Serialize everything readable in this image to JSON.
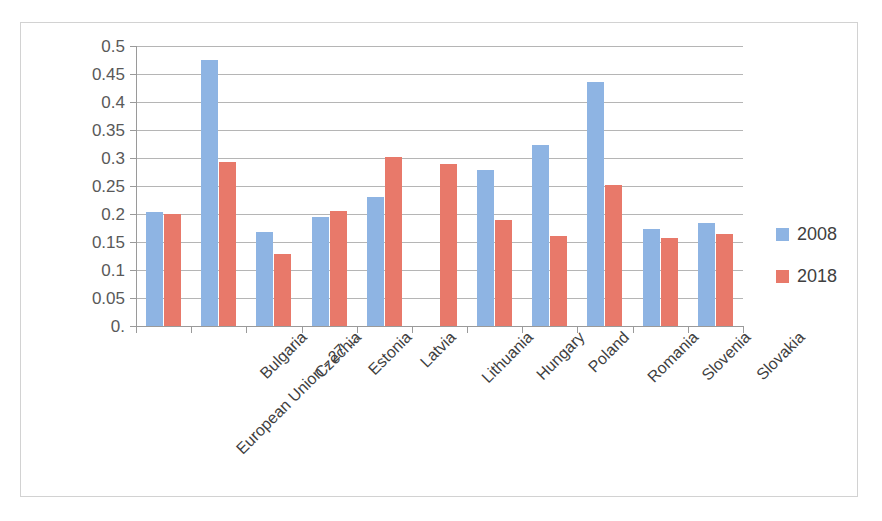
{
  "chart_data": {
    "type": "bar",
    "title": "",
    "xlabel": "",
    "ylabel": "",
    "ylim": [
      0,
      0.5
    ],
    "grid": true,
    "legend_position": "right",
    "ytick_labels": [
      "0.5",
      "0.45",
      "0.4",
      "0.35",
      "0.3",
      "0.25",
      "0.2",
      "0.15",
      "0.1",
      "0.05",
      "0."
    ],
    "ytick_values": [
      0.5,
      0.45,
      0.4,
      0.35,
      0.3,
      0.25,
      0.2,
      0.15,
      0.1,
      0.05,
      0.0
    ],
    "categories": [
      "European Union - 27 ...",
      "Bulgaria",
      "Czechia",
      "Estonia",
      "Latvia",
      "Lithuania",
      "Hungary",
      "Poland",
      "Romania",
      "Slovenia",
      "Slovakia"
    ],
    "series": [
      {
        "name": "2008",
        "color": "#8EB4E3",
        "values": [
          0.203,
          0.475,
          0.168,
          0.195,
          0.23,
          null,
          0.278,
          0.323,
          0.436,
          0.174,
          0.184
        ]
      },
      {
        "name": "2018",
        "color": "#E8796A",
        "values": [
          0.2,
          0.292,
          0.129,
          0.205,
          0.302,
          0.289,
          0.19,
          0.16,
          0.252,
          0.157,
          0.165
        ]
      }
    ]
  },
  "legend": {
    "items": [
      {
        "label": "2008",
        "color": "#8EB4E3"
      },
      {
        "label": "2018",
        "color": "#E8796A"
      }
    ]
  },
  "colors": {
    "series_2008": "#8EB4E3",
    "series_2018": "#E8796A",
    "gridline": "#b5b5b5",
    "axis": "#9a9a9a",
    "border": "#d2d2d2",
    "tick_text": "#595959",
    "category_text": "#3f3f3f"
  }
}
